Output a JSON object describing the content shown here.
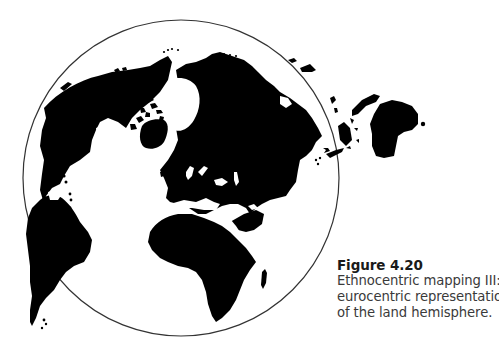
{
  "figure": {
    "label": "Figure 4.20",
    "caption_lines": [
      "Ethnocentric mapping III:",
      "eurocentric representation",
      "of the land hemisphere."
    ]
  },
  "map": {
    "type": "land hemisphere projection",
    "centered_on": "Europe",
    "land_color": "#000000",
    "ocean_color": "#ffffff",
    "outline_color": "#333333"
  }
}
